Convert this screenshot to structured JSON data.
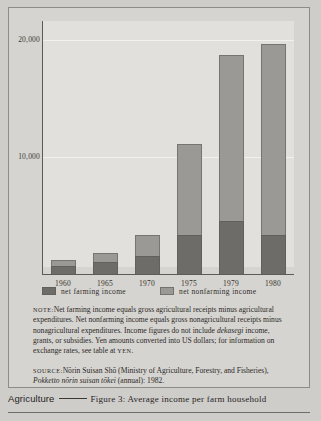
{
  "figure": {
    "axis_title": "US $",
    "y_ticks": [
      "20,000",
      "10,000"
    ],
    "y_tick_values": [
      20000,
      10000
    ]
  },
  "legend": {
    "items": [
      {
        "label": "net farming income",
        "color": "#6e6c69",
        "swatch": "dark-gray-swatch"
      },
      {
        "label": "net nonfarming income",
        "color": "#9b9996",
        "swatch": "light-gray-swatch"
      }
    ]
  },
  "note": {
    "label": "Note:",
    "text_1": "Net farming income equals gross agricultural receipts minus agricultural expenditures.  Net nonfarming income equals gross nonagricultural receipts minus nonagricultural expenditures. Income figures do not include ",
    "italic_1": "dekasegi",
    "text_2": " income, grants, or subsidies.  Yen amounts converted into US dollars; for information on exchange rates, see table at ",
    "small_caps_1": "yen",
    "text_3": "."
  },
  "source": {
    "label": "Source:",
    "text_1": "Nōrin Suisan Shō (Ministry of Agriculture, Forestry, and Fisheries), ",
    "italic_1": "Pokketto nōrin suisan tōkei",
    "text_2": " (annual): 1982."
  },
  "footer": {
    "section": "Agriculture",
    "caption": "Figure 3: Average income per farm household"
  },
  "chart_data": {
    "type": "bar",
    "subtype": "stacked",
    "title": "Average income per farm household",
    "xlabel": "",
    "ylabel": "US $",
    "ylim": [
      0,
      21000
    ],
    "grid": true,
    "gridlines": [
      10000,
      20000
    ],
    "legend_position": "below-axis",
    "categories": [
      "1960",
      "1965",
      "1970",
      "1975",
      "1979",
      "1980"
    ],
    "series": [
      {
        "name": "net farming income",
        "color": "#6e6c69",
        "values": [
          680,
          1060,
          1580,
          3360,
          4540,
          3360
        ]
      },
      {
        "name": "net nonfarming income",
        "color": "#9b9996",
        "values": [
          500,
          710,
          1750,
          7740,
          14120,
          16280
        ]
      }
    ],
    "totals": [
      1180,
      1770,
      3330,
      11100,
      18660,
      19640
    ]
  }
}
